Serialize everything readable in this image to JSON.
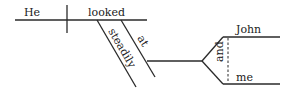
{
  "diagram": {
    "type": "sentence-diagram",
    "sentence": "He looked steadily at John and me",
    "words": {
      "subject": "He",
      "verb": "looked",
      "adverb": "steadily",
      "preposition": "at",
      "conjunction": "and",
      "object_1": "John",
      "object_2": "me"
    },
    "colors": {
      "line": "#2a2a2a",
      "text": "#222222",
      "background": "#ffffff"
    }
  }
}
